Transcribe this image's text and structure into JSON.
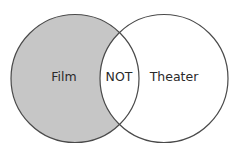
{
  "diagram": {
    "type": "venn",
    "colors": {
      "left_fill": "#c6c6c6",
      "right_fill": "#ffffff",
      "intersection_fill": "#ffffff",
      "stroke": "#4a4a4a",
      "text": "#2a2a2a"
    },
    "sets": [
      {
        "id": "film",
        "label": "Film",
        "shaded": true
      },
      {
        "id": "theater",
        "label": "Theater",
        "shaded": false
      }
    ],
    "intersection": {
      "label": "NOT",
      "shaded": false
    }
  }
}
